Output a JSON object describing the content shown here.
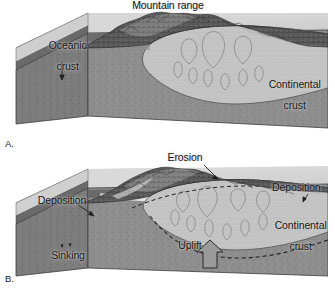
{
  "figure": {
    "panels": [
      {
        "letter": "A.",
        "heading": "Mountain range",
        "labels": [
          {
            "name": "oceanic-crust",
            "text": "Oceanic\ncrust"
          },
          {
            "name": "continental-crust",
            "text": "Continental\ncrust"
          }
        ]
      },
      {
        "letter": "B.",
        "heading": "Erosion",
        "labels": [
          {
            "name": "deposition-left",
            "text": "Deposition"
          },
          {
            "name": "deposition-right",
            "text": "Deposition"
          },
          {
            "name": "continental-crust",
            "text": "Continental\ncrust"
          },
          {
            "name": "uplift",
            "text": "Uplift"
          },
          {
            "name": "sinking",
            "text": "Sinking"
          }
        ]
      }
    ],
    "text": {
      "mountain_range": "Mountain range",
      "oceanic_crust_l1": "Oceanic",
      "oceanic_crust_l2": "crust",
      "continental_crust_a_l1": "Continental",
      "continental_crust_a_l2": "crust",
      "panel_a_letter": "A.",
      "erosion": "Erosion",
      "deposition_left": "Deposition",
      "deposition_right": "Deposition",
      "continental_crust_b_l1": "Continental",
      "continental_crust_b_l2": "crust",
      "uplift": "Uplift",
      "sinking": "Sinking",
      "panel_b_letter": "B."
    },
    "colors": {
      "background": "#ffffff",
      "ocean_top": "#d2d2d2",
      "block_top": "#c9c9c9",
      "oceanic_crust_band": "#6f6f6f",
      "mantle_front": "#8e8e8e",
      "mantle_side": "#7b7b7b",
      "continental_crust": "#c4c4c4",
      "mountain_dark": "#4a4a4a",
      "outline": "#2b2b2b",
      "label_text": "#171717",
      "arrow_fill": "#9a9a9a"
    }
  }
}
